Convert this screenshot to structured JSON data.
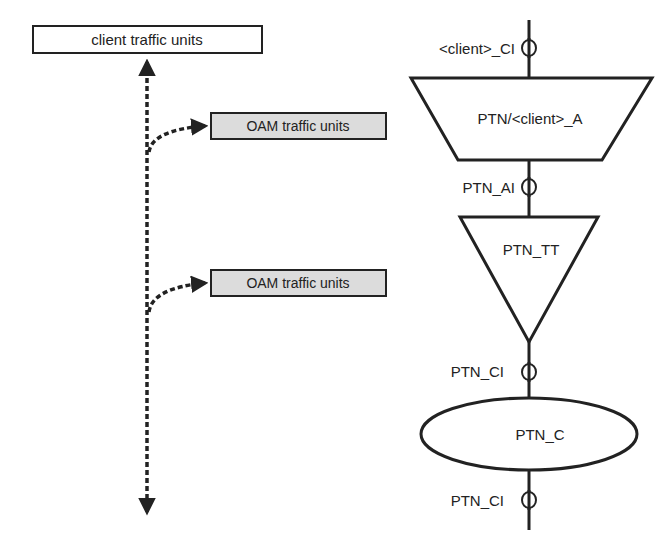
{
  "left_panel": {
    "client_box": {
      "label": "client traffic units",
      "fill": "#ffffff"
    },
    "oam_boxes": [
      {
        "label": "OAM traffic units",
        "fill": "#dcdcdc"
      },
      {
        "label": "OAM traffic units",
        "fill": "#dcdcdc"
      }
    ]
  },
  "right_panel": {
    "points": [
      {
        "label": "<client>_CI"
      },
      {
        "label": "PTN_AI"
      },
      {
        "label": "PTN_CI"
      },
      {
        "label": "PTN_CI"
      }
    ],
    "adaptation": {
      "label": "PTN/<client>_A"
    },
    "trail_termination": {
      "label": "PTN_TT"
    },
    "connection": {
      "label": "PTN_C"
    }
  },
  "colors": {
    "stroke": "#222222",
    "oam_fill": "#dcdcdc",
    "background": "#ffffff"
  }
}
